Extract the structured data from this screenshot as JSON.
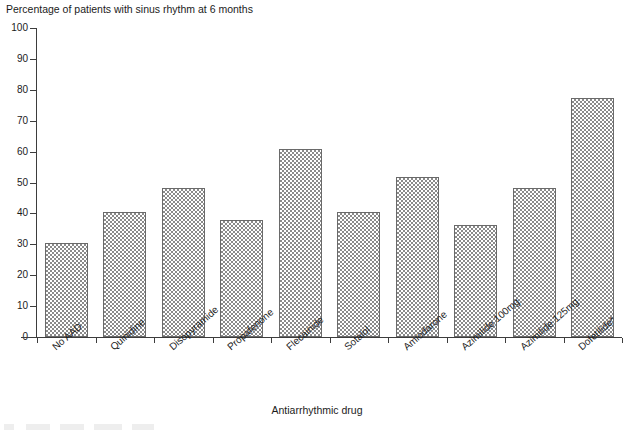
{
  "chart_data": {
    "type": "bar",
    "title": "Percentage of patients with sinus rhythm at 6 months",
    "xlabel": "Antiarrhythmic drug",
    "ylabel": "",
    "ylim": [
      0,
      100
    ],
    "yticks": [
      0,
      10,
      20,
      30,
      40,
      50,
      60,
      70,
      80,
      90,
      100
    ],
    "ytick_labels": [
      "0",
      "10",
      "20",
      "30",
      "40",
      "50",
      "60",
      "70",
      "80",
      "90",
      "100"
    ],
    "grid": false,
    "legend": "none",
    "categories": [
      "No AAD",
      "Quinidine",
      "Disopyramide",
      "Propafenone",
      "Flecainide",
      "Sotalol",
      "Amiodarone",
      "Azimilide 100mg",
      "Azimilide 125mg",
      "Dofetilide*"
    ],
    "values": [
      30.5,
      40.3,
      48.3,
      38.0,
      61.0,
      40.5,
      51.8,
      36.3,
      48.3,
      77.5
    ],
    "bar_fill": "crosshatch-checkerboard",
    "bar_edge_color": "#6a6a6a",
    "bar_pattern_color": "#8a8a8a",
    "axis_color": "#3d3d3d",
    "background_color": "#ffffff"
  }
}
